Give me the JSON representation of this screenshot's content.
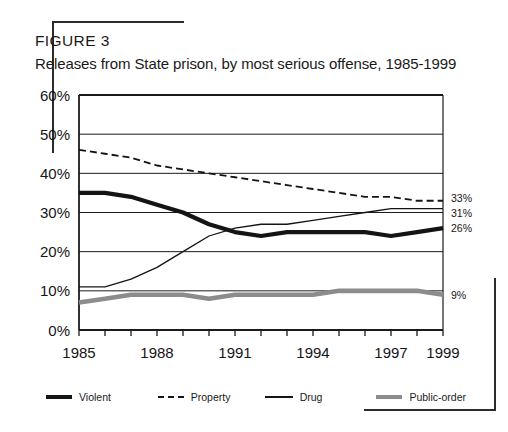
{
  "figure": {
    "label": "FIGURE 3",
    "title": "Releases from State prison, by most serious offense, 1985-1999"
  },
  "legend": {
    "items": [
      {
        "label": "Violent",
        "icon": "thick-solid-line-swatch",
        "color": "#141414"
      },
      {
        "label": "Property",
        "icon": "dashed-line-swatch",
        "color": "#141414"
      },
      {
        "label": "Drug",
        "icon": "thin-solid-line-swatch",
        "color": "#141414"
      },
      {
        "label": "Public-order",
        "icon": "thick-gray-line-swatch",
        "color": "#8c8c8c"
      }
    ]
  },
  "end_labels": [
    {
      "series": "Property",
      "text": "33%"
    },
    {
      "series": "Drug",
      "text": "31%"
    },
    {
      "series": "Violent",
      "text": "26%"
    },
    {
      "series": "Public-order",
      "text": "9%"
    }
  ],
  "axis": {
    "y_ticks": [
      "0%",
      "10%",
      "20%",
      "30%",
      "40%",
      "50%",
      "60%"
    ],
    "x_ticks": [
      "1985",
      "1988",
      "1991",
      "1994",
      "1997",
      "1999"
    ]
  },
  "chart_data": {
    "type": "line",
    "title": "Releases from State prison, by most serious offense, 1985-1999",
    "xlabel": "",
    "ylabel": "",
    "ylim": [
      0,
      60
    ],
    "xlim": [
      1985,
      1999
    ],
    "grid": true,
    "legend_position": "bottom",
    "x": [
      1985,
      1986,
      1987,
      1988,
      1989,
      1990,
      1991,
      1992,
      1993,
      1994,
      1995,
      1996,
      1997,
      1998,
      1999
    ],
    "x_tick_labels": [
      "1985",
      "1988",
      "1991",
      "1994",
      "1997",
      "1999"
    ],
    "y_tick_labels": [
      "0%",
      "10%",
      "20%",
      "30%",
      "40%",
      "50%",
      "60%"
    ],
    "series": [
      {
        "name": "Violent",
        "style": "thick-solid",
        "color": "#141414",
        "end_label": "26%",
        "values": [
          35,
          35,
          34,
          32,
          30,
          27,
          25,
          24,
          25,
          25,
          25,
          25,
          24,
          25,
          26
        ]
      },
      {
        "name": "Property",
        "style": "dashed",
        "color": "#141414",
        "end_label": "33%",
        "values": [
          46,
          45,
          44,
          42,
          41,
          40,
          39,
          38,
          37,
          36,
          35,
          34,
          34,
          33,
          33
        ]
      },
      {
        "name": "Drug",
        "style": "thin-solid",
        "color": "#141414",
        "end_label": "31%",
        "values": [
          11,
          11,
          13,
          16,
          20,
          24,
          26,
          27,
          27,
          28,
          29,
          30,
          31,
          31,
          31
        ]
      },
      {
        "name": "Public-order",
        "style": "thick-gray",
        "color": "#8c8c8c",
        "end_label": "9%",
        "values": [
          7,
          8,
          9,
          9,
          9,
          8,
          9,
          9,
          9,
          9,
          10,
          10,
          10,
          10,
          9
        ]
      }
    ]
  }
}
